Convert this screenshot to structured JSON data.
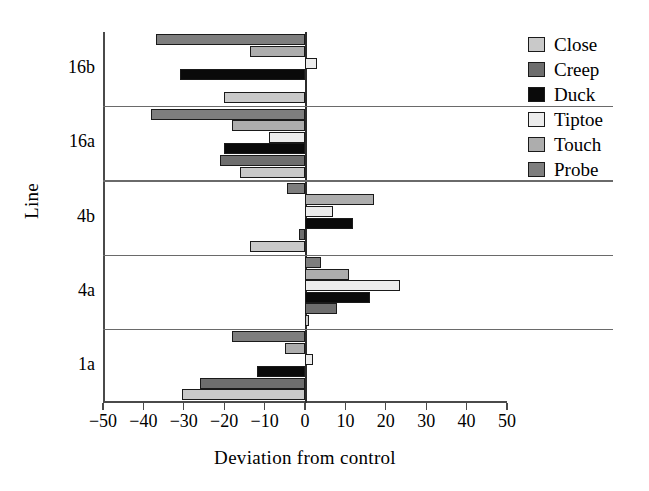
{
  "chart_data": {
    "type": "bar",
    "orientation": "horizontal",
    "title": "",
    "xlabel": "Deviation from control",
    "ylabel": "Line",
    "xlim": [
      -50,
      50
    ],
    "xticks": [
      -50,
      -40,
      -30,
      -20,
      -10,
      0,
      10,
      20,
      30,
      40,
      50
    ],
    "xticklabels": [
      "−50",
      "−40",
      "−30",
      "−20",
      "−10",
      "0",
      "10",
      "20",
      "30",
      "40",
      "50"
    ],
    "categories": [
      "16b",
      "16a",
      "4b",
      "4a",
      "1a"
    ],
    "grid": false,
    "legend_position": "upper right",
    "series": [
      {
        "name": "Close",
        "color": "#c9c9c9",
        "values": [
          -20.0,
          -16.0,
          -13.5,
          1.0,
          -30.5
        ]
      },
      {
        "name": "Creep",
        "color": "#6e6e6e",
        "values": [
          0.0,
          -21.0,
          -1.5,
          8.0,
          -26.0
        ]
      },
      {
        "name": "Duck",
        "color": "#0a0a0a",
        "values": [
          -31.0,
          -20.0,
          12.0,
          16.0,
          -12.0
        ]
      },
      {
        "name": "Tiptoe",
        "color": "#ececec",
        "values": [
          3.0,
          -9.0,
          7.0,
          23.5,
          2.0
        ]
      },
      {
        "name": "Touch",
        "color": "#adadad",
        "values": [
          -13.5,
          -18.0,
          17.0,
          11.0,
          -5.0
        ]
      },
      {
        "name": "Probe",
        "color": "#7e7e7e",
        "values": [
          -37.0,
          -38.0,
          -4.5,
          4.0,
          -18.0
        ]
      }
    ]
  },
  "legend": {
    "items": [
      {
        "label": "Close"
      },
      {
        "label": "Creep"
      },
      {
        "label": "Duck"
      },
      {
        "label": "Tiptoe"
      },
      {
        "label": "Touch"
      },
      {
        "label": "Probe"
      }
    ]
  }
}
